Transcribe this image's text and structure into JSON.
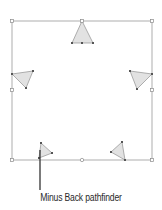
{
  "caption": {
    "label": "Minus Back pathfinder"
  },
  "colors": {
    "frame_stroke": "#9a9a9a",
    "handle_fill": "#ffffff",
    "handle_stroke": "#8a8a8a",
    "triangle_fill": "#e2e2e2",
    "triangle_stroke": "#8f8f8f",
    "anchor_fill": "#555555",
    "callout_line": "#333333"
  },
  "frame": {
    "x": 12,
    "y": 21,
    "width": 140,
    "height": 139
  },
  "triangles": [
    {
      "name": "triangle-top",
      "points": [
        [
          82,
          21
        ],
        [
          72,
          43
        ],
        [
          93,
          43
        ]
      ],
      "anchors": [
        [
          72,
          43
        ],
        [
          82,
          43
        ],
        [
          93,
          43
        ]
      ]
    },
    {
      "name": "triangle-left",
      "points": [
        [
          12,
          74
        ],
        [
          33,
          71
        ],
        [
          26,
          88
        ]
      ],
      "anchors": [
        [
          12,
          74
        ],
        [
          33,
          71
        ],
        [
          26,
          88
        ]
      ]
    },
    {
      "name": "triangle-right",
      "points": [
        [
          130,
          71
        ],
        [
          152,
          74
        ],
        [
          137,
          89
        ]
      ],
      "anchors": [
        [
          130,
          71
        ],
        [
          152,
          74
        ],
        [
          137,
          89
        ]
      ]
    },
    {
      "name": "triangle-bottom-left",
      "points": [
        [
          41,
          143
        ],
        [
          52,
          153
        ],
        [
          39,
          158
        ]
      ],
      "anchors": [
        [
          41,
          143
        ],
        [
          52,
          153
        ],
        [
          39,
          158
        ]
      ]
    },
    {
      "name": "triangle-bottom-right",
      "points": [
        [
          122,
          142
        ],
        [
          111,
          152
        ],
        [
          125,
          160
        ]
      ],
      "anchors": [
        [
          122,
          142
        ],
        [
          111,
          152
        ],
        [
          125,
          160
        ]
      ]
    }
  ],
  "callout": {
    "x": 40,
    "y1": 150,
    "y2": 190
  }
}
